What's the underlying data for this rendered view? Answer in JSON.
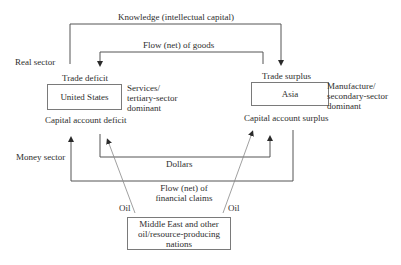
{
  "diagram": {
    "sector_labels": {
      "real": "Real sector",
      "money": "Money sector"
    },
    "nodes": {
      "us": {
        "label": "United States",
        "top_note": "Trade deficit",
        "bottom_note": "Capital account deficit",
        "side_note_1": "Services/",
        "side_note_2": "tertiary-sector",
        "side_note_3": "dominant"
      },
      "asia": {
        "label": "Asia",
        "top_note": "Trade surplus",
        "bottom_note": "Capital account surplus",
        "side_note_1": "Manufacture/",
        "side_note_2": "secondary-sector",
        "side_note_3": "dominant"
      },
      "mideast": {
        "line1": "Middle East and other",
        "line2": "oil/resource-producing",
        "line3": "nations"
      }
    },
    "flows": {
      "knowledge": "Knowledge (intellectual capital)",
      "goods": "Flow (net) of goods",
      "dollars": "Dollars",
      "claims_line1": "Flow (net) of",
      "claims_line2": "financial claims",
      "oil_left": "Oil",
      "oil_right": "Oil"
    }
  }
}
